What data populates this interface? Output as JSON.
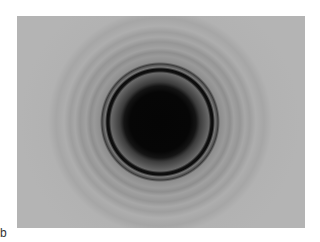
{
  "figure": {
    "panel_label": "b",
    "colors": {
      "background": "#b4b4b4",
      "core": "#050505",
      "ring": "#0a0a0a"
    }
  }
}
